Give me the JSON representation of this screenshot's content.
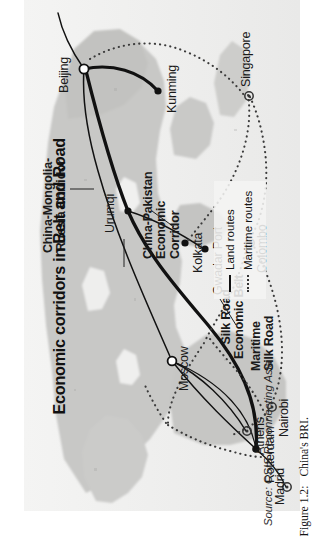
{
  "figure": {
    "title": "Economic corridors in Belt and Road",
    "source": "Source: CSIS Reconnecting Asia",
    "caption_number": "Figure 1.2:",
    "caption_text": "China's BRI."
  },
  "legend": {
    "items": [
      {
        "label": "Land routes",
        "style": "solid",
        "icon": "solid-line-icon"
      },
      {
        "label": "Maritime routes",
        "style": "dotted",
        "icon": "dotted-line-icon"
      }
    ]
  },
  "corridors": [
    {
      "id": "cmr",
      "label": "China-Mongolia-\nRussia Corridor"
    },
    {
      "id": "srb",
      "label": "Silk Road\nEconomic Belt"
    },
    {
      "id": "cpec",
      "label": "China-Pakistan\nEconomic\nCorridor"
    },
    {
      "id": "msr",
      "label": "Maritime\nSilk Road"
    }
  ],
  "cities": [
    {
      "name": "Beijing",
      "marker": "hollow-circle"
    },
    {
      "name": "Urumqi",
      "marker": "filled-dot"
    },
    {
      "name": "Kunming",
      "marker": "filled-dot"
    },
    {
      "name": "Kolkata",
      "marker": "filled-dot"
    },
    {
      "name": "Gwadar Port",
      "marker": "filled-dot"
    },
    {
      "name": "Moscow",
      "marker": "hollow-circle"
    },
    {
      "name": "Rotterdam",
      "marker": "filled-dot"
    },
    {
      "name": "Madrid",
      "marker": "star"
    },
    {
      "name": "Athens",
      "marker": "star"
    },
    {
      "name": "Colombo",
      "marker": "star"
    },
    {
      "name": "Singapore",
      "marker": "star"
    },
    {
      "name": "Nairobi",
      "marker": "star"
    }
  ],
  "colors": {
    "land": "#c9c9c7",
    "sea": "#f2f2f1",
    "plate_bg": "#e2e2e0",
    "route_land": "#111111",
    "route_maritime": "#3a3a3a",
    "text": "#1a1a1a"
  }
}
